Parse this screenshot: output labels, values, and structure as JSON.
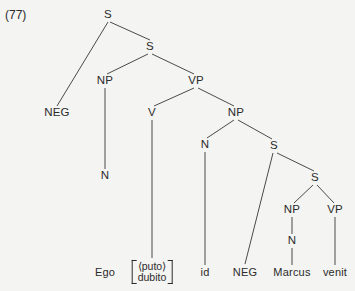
{
  "figure": {
    "example_number": "(77)",
    "type": "syntax-tree",
    "background_color": "#f4f4f2",
    "line_color": "#4a4a4a",
    "text_color": "#2b2b2b"
  },
  "nodes": [
    {
      "id": "s-root",
      "label": "S",
      "x": 108,
      "y": 15,
      "kind": "nonterminal"
    },
    {
      "id": "s-second",
      "label": "S",
      "x": 150,
      "y": 47,
      "kind": "nonterminal"
    },
    {
      "id": "np-subject",
      "label": "NP",
      "x": 105,
      "y": 81,
      "kind": "nonterminal"
    },
    {
      "id": "vp-main",
      "label": "VP",
      "x": 196,
      "y": 81,
      "kind": "nonterminal"
    },
    {
      "id": "neg-upper",
      "label": "NEG",
      "x": 57,
      "y": 113,
      "kind": "nonterminal"
    },
    {
      "id": "v-main",
      "label": "V",
      "x": 152,
      "y": 113,
      "kind": "nonterminal"
    },
    {
      "id": "np-object",
      "label": "NP",
      "x": 236,
      "y": 113,
      "kind": "nonterminal"
    },
    {
      "id": "n-subject",
      "label": "N",
      "x": 105,
      "y": 176,
      "kind": "nonterminal"
    },
    {
      "id": "n-object",
      "label": "N",
      "x": 205,
      "y": 145,
      "kind": "nonterminal"
    },
    {
      "id": "s-embedded",
      "label": "S",
      "x": 274,
      "y": 146,
      "kind": "nonterminal"
    },
    {
      "id": "s-inner",
      "label": "S",
      "x": 315,
      "y": 178,
      "kind": "nonterminal"
    },
    {
      "id": "np-inner",
      "label": "NP",
      "x": 292,
      "y": 210,
      "kind": "nonterminal"
    },
    {
      "id": "vp-inner",
      "label": "VP",
      "x": 335,
      "y": 210,
      "kind": "nonterminal"
    },
    {
      "id": "n-inner",
      "label": "N",
      "x": 292,
      "y": 241,
      "kind": "nonterminal"
    }
  ],
  "terminals": [
    {
      "id": "term-ego",
      "label": "Ego",
      "x": 105,
      "y": 272
    },
    {
      "id": "term-id",
      "label": "id",
      "x": 205,
      "y": 272
    },
    {
      "id": "term-neg",
      "label": "NEG",
      "x": 245,
      "y": 272
    },
    {
      "id": "term-marcus",
      "label": "Marcus",
      "x": 292,
      "y": 272
    },
    {
      "id": "term-venit",
      "label": "venit",
      "x": 335,
      "y": 272
    }
  ],
  "bracket_terminal": {
    "id": "term-puto-dubito",
    "x": 152,
    "y": 272,
    "line_one": "⟨puto⟩",
    "line_two": "dubito"
  },
  "edges": [
    {
      "from": "s-root",
      "to": "neg-upper",
      "x1": 108,
      "y1": 22,
      "x2": 57,
      "y2": 106
    },
    {
      "from": "s-root",
      "to": "s-second",
      "x1": 110,
      "y1": 22,
      "x2": 150,
      "y2": 40
    },
    {
      "from": "s-second",
      "to": "np-subject",
      "x1": 148,
      "y1": 54,
      "x2": 107,
      "y2": 74
    },
    {
      "from": "s-second",
      "to": "vp-main",
      "x1": 152,
      "y1": 54,
      "x2": 194,
      "y2": 74
    },
    {
      "from": "np-subject",
      "to": "n-subject",
      "x1": 105,
      "y1": 88,
      "x2": 105,
      "y2": 169
    },
    {
      "from": "vp-main",
      "to": "v-main",
      "x1": 194,
      "y1": 88,
      "x2": 154,
      "y2": 106
    },
    {
      "from": "vp-main",
      "to": "np-object",
      "x1": 198,
      "y1": 88,
      "x2": 234,
      "y2": 106
    },
    {
      "from": "v-main",
      "to": "term-puto-dubito",
      "x1": 152,
      "y1": 120,
      "x2": 152,
      "y2": 258
    },
    {
      "from": "np-object",
      "to": "n-object",
      "x1": 234,
      "y1": 120,
      "x2": 207,
      "y2": 138
    },
    {
      "from": "np-object",
      "to": "s-embedded",
      "x1": 238,
      "y1": 120,
      "x2": 272,
      "y2": 139
    },
    {
      "from": "n-object",
      "to": "term-id",
      "x1": 205,
      "y1": 152,
      "x2": 205,
      "y2": 265
    },
    {
      "from": "s-embedded",
      "to": "term-neg",
      "x1": 273,
      "y1": 153,
      "x2": 245,
      "y2": 264
    },
    {
      "from": "s-embedded",
      "to": "s-inner",
      "x1": 277,
      "y1": 153,
      "x2": 314,
      "y2": 171
    },
    {
      "from": "s-inner",
      "to": "np-inner",
      "x1": 313,
      "y1": 185,
      "x2": 294,
      "y2": 203
    },
    {
      "from": "s-inner",
      "to": "vp-inner",
      "x1": 317,
      "y1": 185,
      "x2": 334,
      "y2": 203
    },
    {
      "from": "np-inner",
      "to": "n-inner",
      "x1": 292,
      "y1": 217,
      "x2": 292,
      "y2": 234
    },
    {
      "from": "n-inner",
      "to": "term-marcus",
      "x1": 292,
      "y1": 248,
      "x2": 292,
      "y2": 265
    },
    {
      "from": "vp-inner",
      "to": "term-venit",
      "x1": 335,
      "y1": 217,
      "x2": 335,
      "y2": 265
    }
  ]
}
